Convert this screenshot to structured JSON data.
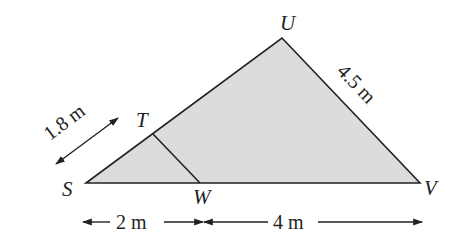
{
  "diagram": {
    "type": "geometry-triangle",
    "fill_color": "#dcdcdc",
    "stroke_color": "#222222",
    "vertices": {
      "S": {
        "label": "S",
        "x": 86,
        "y": 183
      },
      "U": {
        "label": "U",
        "x": 282,
        "y": 38
      },
      "V": {
        "label": "V",
        "x": 420,
        "y": 183
      },
      "T": {
        "label": "T",
        "x": 153,
        "y": 134
      },
      "W": {
        "label": "W",
        "x": 200,
        "y": 183
      }
    },
    "measurements": {
      "ST": "1.8 m",
      "UV": "4.5 m",
      "SW": "2 m",
      "WV": "4 m"
    }
  }
}
